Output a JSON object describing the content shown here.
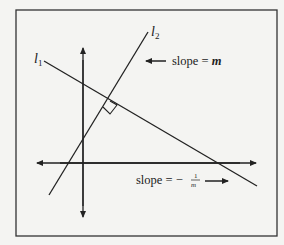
{
  "diagram": {
    "lines": [
      {
        "id": "l1",
        "label_main": "l",
        "label_sub": "1"
      },
      {
        "id": "l2",
        "label_main": "l",
        "label_sub": "2"
      }
    ],
    "annotations": {
      "l2_slope": {
        "text": "slope = ",
        "var": "m"
      },
      "l1_slope": {
        "text": "slope = −",
        "num": "1",
        "den": "m"
      }
    },
    "colors": {
      "line": "#222222",
      "background": "#f4f4f2",
      "frame": "#333333"
    }
  }
}
